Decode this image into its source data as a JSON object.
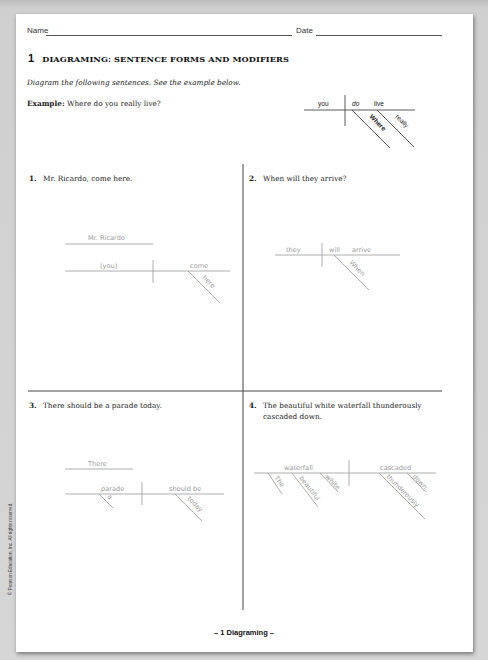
{
  "header": {
    "name_label": "Name",
    "date_label": "Date"
  },
  "section": {
    "number": "1",
    "title": "DIAGRAMING: SENTENCE FORMS AND MODIFIERS"
  },
  "instructions": "Diagram the following sentences. See the example below.",
  "example": {
    "label": "Example:",
    "sentence": "Where do you really live?",
    "diagram": {
      "subject": "you",
      "verb_helper": "do",
      "verb": "live",
      "modifiers": [
        "Where",
        "really"
      ]
    }
  },
  "questions": [
    {
      "number": "1.",
      "sentence": "Mr. Ricardo, come here.",
      "diagram": {
        "address": "Mr. Ricardo",
        "subject": "(you)",
        "verb": "come",
        "modifiers": [
          "here"
        ]
      }
    },
    {
      "number": "2.",
      "sentence": "When will they arrive?",
      "diagram": {
        "subject": "they",
        "verb_helper": "will",
        "verb": "arrive",
        "modifiers": [
          "When"
        ]
      }
    },
    {
      "number": "3.",
      "sentence": "There should be a parade today.",
      "diagram": {
        "expletive": "There",
        "subject": "parade",
        "subject_modifiers": [
          "a"
        ],
        "verb": "should be",
        "verb_modifiers": [
          "today"
        ]
      }
    },
    {
      "number": "4.",
      "sentence_line1": "The beautiful white waterfall thunderously",
      "sentence_line2": "cascaded down.",
      "diagram": {
        "subject": "waterfall",
        "subject_modifiers": [
          "The",
          "beautiful",
          "white"
        ],
        "verb": "cascaded",
        "verb_modifiers": [
          "thunderously",
          "down"
        ]
      }
    }
  ],
  "footer": {
    "page": "– 1   Diagraming –"
  },
  "copyright": "© Pearson Education, Inc. All rights reserved."
}
